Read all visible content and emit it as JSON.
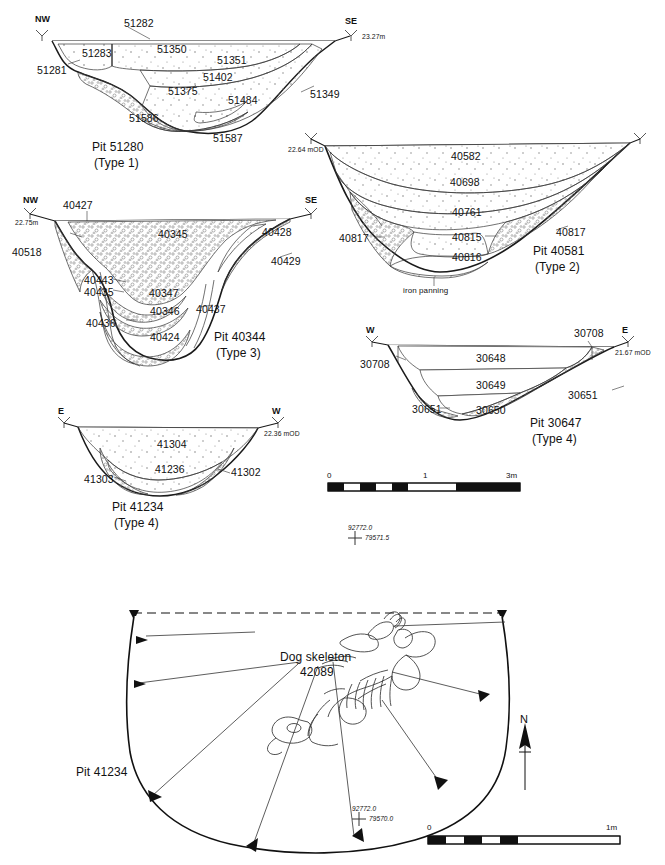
{
  "figure": {
    "stroke_color": "#1a1a1a",
    "fill_color": "#ffffff",
    "stipple_color": "#6b6b6b"
  },
  "sections": [
    {
      "id": "pit-51280",
      "pit_label": "Pit 51280",
      "type_label": "(Type 1)",
      "left_marker": {
        "compass": "NW",
        "datum": ""
      },
      "right_marker": {
        "compass": "SE",
        "datum": "23.27m"
      },
      "context_numbers": [
        "51282",
        "51283",
        "51350",
        "51351",
        "51281",
        "51402",
        "51375",
        "51484",
        "51349",
        "51586",
        "51587"
      ]
    },
    {
      "id": "pit-40581",
      "pit_label": "Pit 40581",
      "type_label": "(Type 2)",
      "left_marker": {
        "compass": "",
        "datum": "22.64 mOD"
      },
      "right_marker": {
        "compass": "",
        "datum": ""
      },
      "context_numbers": [
        "40582",
        "40698",
        "40761",
        "40817",
        "40815",
        "40816",
        "40817"
      ],
      "annotation": "iron panning"
    },
    {
      "id": "pit-40344",
      "pit_label": "Pit 40344",
      "type_label": "(Type 3)",
      "left_marker": {
        "compass": "NW",
        "datum": "22.75m"
      },
      "right_marker": {
        "compass": "SE",
        "datum": ""
      },
      "context_numbers": [
        "40427",
        "40345",
        "40428",
        "40429",
        "40518",
        "40443",
        "40435",
        "40347",
        "40346",
        "40437",
        "40436",
        "40424"
      ]
    },
    {
      "id": "pit-30647",
      "pit_label": "Pit 30647",
      "type_label": "(Type 4)",
      "left_marker": {
        "compass": "W",
        "datum": ""
      },
      "right_marker": {
        "compass": "E",
        "datum": "21.67 mOD"
      },
      "context_numbers": [
        "30708",
        "30648",
        "30708",
        "30649",
        "30651",
        "30651",
        "30650"
      ]
    },
    {
      "id": "pit-41234-section",
      "pit_label": "Pit 41234",
      "type_label": "(Type 4)",
      "left_marker": {
        "compass": "E",
        "datum": ""
      },
      "right_marker": {
        "compass": "W",
        "datum": "22.36 mOD"
      },
      "context_numbers": [
        "41304",
        "41236",
        "41303",
        "41302"
      ]
    }
  ],
  "section_scale_bar": {
    "start_label": "0",
    "mid_label": "1",
    "end_label": "3m"
  },
  "section_grid_point": {
    "easting": "92772.0",
    "northing": "79571.5"
  },
  "plan": {
    "pit_label": "Pit 41234",
    "feature_label": "Dog skeleton",
    "feature_number": "42089",
    "north_label": "N",
    "grid_point": {
      "easting": "92772.0",
      "northing": "79570.0"
    },
    "scale_bar": {
      "start_label": "0",
      "end_label": "1m"
    }
  }
}
